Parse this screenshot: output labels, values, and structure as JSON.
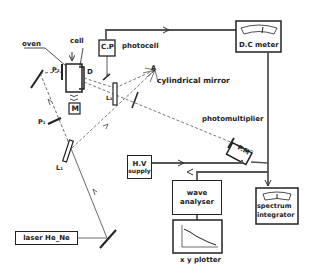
{
  "diagram": {
    "colors": {
      "ink": "#222222",
      "background": "#ffffff",
      "wire": "#555555"
    },
    "components": {
      "oven": "oven",
      "cell": "cell",
      "cp_box": "C.P",
      "photocell": "photocell",
      "dc_meter": "D.C meter",
      "cylindrical_mirror": "cylindrical mirror",
      "point_a": "A",
      "photomultiplier": "photomultiplier",
      "pm_box": "P.M",
      "hv_supply_line1": "H.V",
      "hv_supply_line2": "supply",
      "wave_analyser_line1": "wave",
      "wave_analyser_line2": "analyser",
      "spectrum_integrator_line1": "spectrum",
      "spectrum_integrator_line2": "integrator",
      "xy_plotter": "x y plotter",
      "laser": "laser He_Ne",
      "motor": "M"
    },
    "optical_labels": {
      "p1": "P₁",
      "p2": "P₂",
      "l1": "L₁",
      "l2": "L₂",
      "d": "D"
    }
  }
}
